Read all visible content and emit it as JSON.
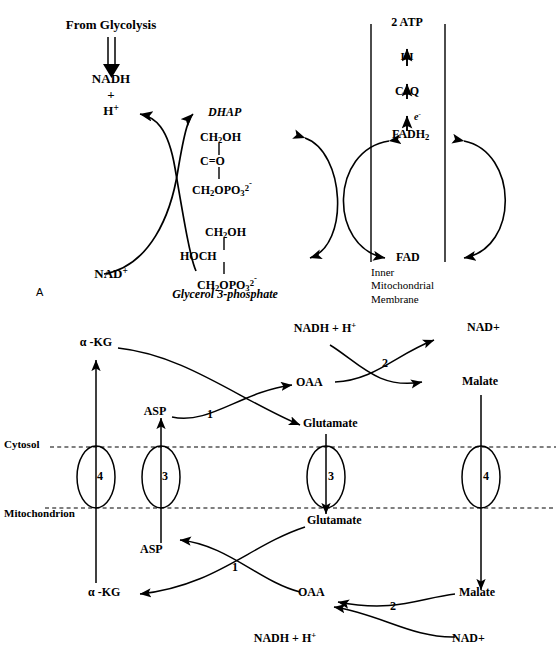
{
  "figure": {
    "background": "#ffffff",
    "ink": "#000000",
    "width": 556,
    "height": 659
  },
  "panel_a": {
    "letter": "A",
    "name": "Glycerol 3-phosphate shuttle",
    "source_label": "From Glycolysis",
    "nadh_label": "NADH",
    "plus_label": "+",
    "proton_label": "H",
    "proton_sup": "+",
    "nad_label": "NAD",
    "nad_sup": "+",
    "dhap_label": "DHAP",
    "dhap_structure": [
      "CH2OH",
      "C=O",
      "CH2OPO32-"
    ],
    "dhap_struct_lines": [
      {
        "pre": "CH",
        "sub1": "2",
        "post": "OH",
        "sup": ""
      },
      {
        "pre": "C=O",
        "sub1": "",
        "post": "",
        "sup": ""
      },
      {
        "pre": "CH",
        "sub1": "2",
        "post": "OPO",
        "sub2": "3",
        "sup2": "2",
        "sup": "-"
      }
    ],
    "g3p_label": "Glycerol 3-phosphate",
    "g3p_struct_lines": [
      {
        "text": "CH2OH"
      },
      {
        "text": "HOCH"
      },
      {
        "text": "CH2OPO32-"
      }
    ],
    "atp_label": "2 ATP",
    "complex_label": "III",
    "coq_label": "CoQ",
    "electron_label": "e",
    "electron_sup": "-",
    "fadh2_label": "FADH",
    "fadh2_sub": "2",
    "fad_label": "FAD",
    "membrane_caption": [
      "Inner",
      "Mitochondrial",
      "Membrane"
    ]
  },
  "panel_b": {
    "name": "Malate-aspartate shuttle",
    "compartment_upper": "Cytosol",
    "compartment_lower": "Mitochondrion",
    "cytosol": {
      "akg_label": "α -KG",
      "asp_label": "ASP",
      "oaa_label": "OAA",
      "glutamate_label": "Glutamate",
      "nadh_label": "NADH  + H",
      "nadh_sup": "+",
      "nad_label": "NAD+",
      "malate_label": "Malate",
      "enzyme_1": "1",
      "enzyme_2": "2"
    },
    "matrix": {
      "glutamate_label": "Glutamate",
      "asp_label": "ASP",
      "akg_label": "α -KG",
      "oaa_label": "OAA",
      "malate_label": "Malate",
      "nadh_label": "NADH + H",
      "nadh_sup": "+",
      "nad_label": "NAD+",
      "enzyme_1": "1",
      "enzyme_2": "2"
    },
    "transporters": [
      {
        "id": "t-akg-left",
        "label": "4"
      },
      {
        "id": "t-asp-left",
        "label": "3"
      },
      {
        "id": "t-glu-mid",
        "label": "3"
      },
      {
        "id": "t-malate-right",
        "label": "4"
      }
    ]
  }
}
